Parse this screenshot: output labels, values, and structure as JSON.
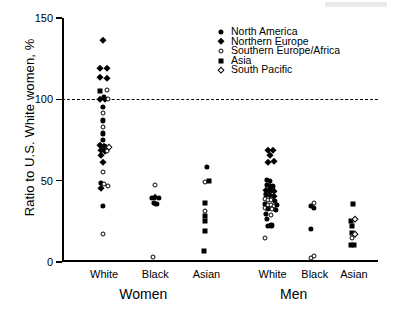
{
  "chart_data": {
    "type": "scatter",
    "title": "",
    "xlabel": "",
    "ylabel": "Ratio to U.S. White women, %",
    "ylim": [
      0,
      150
    ],
    "yticks": [
      0,
      50,
      100,
      150
    ],
    "grid": false,
    "legend_position": "top-right",
    "reference_line": {
      "y": 100,
      "style": "dashed",
      "label": ""
    },
    "group_labels": [
      {
        "label": "Women",
        "x_center": 27
      },
      {
        "label": "Men",
        "x_center": 77
      }
    ],
    "categories": [
      {
        "label": "White",
        "group": "Women",
        "x": 14
      },
      {
        "label": "Black",
        "group": "Women",
        "x": 31
      },
      {
        "label": "Asian",
        "group": "Women",
        "x": 48
      },
      {
        "label": "White",
        "group": "Men",
        "x": 70
      },
      {
        "label": "Black",
        "group": "Men",
        "x": 84
      },
      {
        "label": "Asian",
        "group": "Men",
        "x": 97
      }
    ],
    "series": [
      {
        "name": "North America",
        "marker": "filled-circle"
      },
      {
        "name": "Northern Europe",
        "marker": "filled-diamond"
      },
      {
        "name": "Southern Europe/Africa",
        "marker": "open-circle"
      },
      {
        "name": "Asia",
        "marker": "filled-square"
      },
      {
        "name": "South Pacific",
        "marker": "open-diamond"
      }
    ],
    "points": [
      {
        "x": 13.6,
        "y": 136.5,
        "series": "Northern Europe"
      },
      {
        "x": 12.6,
        "y": 119.5,
        "series": "Northern Europe"
      },
      {
        "x": 14.8,
        "y": 119.5,
        "series": "Northern Europe"
      },
      {
        "x": 12.6,
        "y": 113.5,
        "series": "Northern Europe"
      },
      {
        "x": 14.9,
        "y": 113.0,
        "series": "Northern Europe"
      },
      {
        "x": 12.7,
        "y": 105.0,
        "series": "Asia"
      },
      {
        "x": 15.0,
        "y": 105.5,
        "series": "Southern Europe/Africa"
      },
      {
        "x": 13.9,
        "y": 101.5,
        "series": "North America"
      },
      {
        "x": 12.6,
        "y": 100.5,
        "series": "Northern Europe"
      },
      {
        "x": 14.3,
        "y": 100.0,
        "series": "Northern Europe"
      },
      {
        "x": 15.2,
        "y": 100.0,
        "series": "Southern Europe/Africa"
      },
      {
        "x": 13.6,
        "y": 95.5,
        "series": "North America"
      },
      {
        "x": 13.6,
        "y": 91.5,
        "series": "Southern Europe/Africa"
      },
      {
        "x": 13.6,
        "y": 87.0,
        "series": "North America"
      },
      {
        "x": 13.7,
        "y": 83.0,
        "series": "Southern Europe/Africa"
      },
      {
        "x": 13.6,
        "y": 79.0,
        "series": "North America"
      },
      {
        "x": 13.6,
        "y": 75.0,
        "series": "North America"
      },
      {
        "x": 12.7,
        "y": 72.0,
        "series": "Northern Europe"
      },
      {
        "x": 13.9,
        "y": 71.5,
        "series": "Northern Europe"
      },
      {
        "x": 14.7,
        "y": 71.0,
        "series": "Northern Europe"
      },
      {
        "x": 15.6,
        "y": 70.5,
        "series": "South Pacific"
      },
      {
        "x": 13.0,
        "y": 69.0,
        "series": "Northern Europe"
      },
      {
        "x": 14.2,
        "y": 68.5,
        "series": "Northern Europe"
      },
      {
        "x": 14.9,
        "y": 68.0,
        "series": "Southern Europe/Africa"
      },
      {
        "x": 12.9,
        "y": 66.0,
        "series": "Northern Europe"
      },
      {
        "x": 13.6,
        "y": 61.5,
        "series": "Northern Europe"
      },
      {
        "x": 13.6,
        "y": 55.5,
        "series": "Southern Europe/Africa"
      },
      {
        "x": 13.0,
        "y": 48.5,
        "series": "North America"
      },
      {
        "x": 14.0,
        "y": 48.0,
        "series": "Southern Europe/Africa"
      },
      {
        "x": 15.2,
        "y": 47.0,
        "series": "Southern Europe/Africa"
      },
      {
        "x": 13.0,
        "y": 45.5,
        "series": "Northern Europe"
      },
      {
        "x": 13.6,
        "y": 34.5,
        "series": "North America"
      },
      {
        "x": 13.5,
        "y": 17.5,
        "series": "Southern Europe/Africa"
      },
      {
        "x": 31.0,
        "y": 47.5,
        "series": "Southern Europe/Africa"
      },
      {
        "x": 29.8,
        "y": 39.5,
        "series": "North America"
      },
      {
        "x": 31.0,
        "y": 40.0,
        "series": "Northern Europe"
      },
      {
        "x": 32.2,
        "y": 39.5,
        "series": "North America"
      },
      {
        "x": 30.5,
        "y": 36.5,
        "series": "North America"
      },
      {
        "x": 31.4,
        "y": 35.5,
        "series": "North America"
      },
      {
        "x": 30.4,
        "y": 3.0,
        "series": "Southern Europe/Africa"
      },
      {
        "x": 48.2,
        "y": 58.5,
        "series": "North America"
      },
      {
        "x": 47.6,
        "y": 49.0,
        "series": "Southern Europe/Africa"
      },
      {
        "x": 48.8,
        "y": 50.0,
        "series": "Asia"
      },
      {
        "x": 47.5,
        "y": 36.0,
        "series": "Asia"
      },
      {
        "x": 47.5,
        "y": 31.5,
        "series": "Southern Europe/Africa"
      },
      {
        "x": 47.5,
        "y": 28.5,
        "series": "Asia"
      },
      {
        "x": 47.5,
        "y": 25.5,
        "series": "Asia"
      },
      {
        "x": 47.4,
        "y": 19.0,
        "series": "Asia"
      },
      {
        "x": 47.3,
        "y": 6.5,
        "series": "Asia"
      },
      {
        "x": 68.5,
        "y": 69.0,
        "series": "Northern Europe"
      },
      {
        "x": 70.2,
        "y": 69.0,
        "series": "Northern Europe"
      },
      {
        "x": 69.0,
        "y": 65.5,
        "series": "Northern Europe"
      },
      {
        "x": 68.6,
        "y": 61.5,
        "series": "Northern Europe"
      },
      {
        "x": 70.4,
        "y": 62.0,
        "series": "Northern Europe"
      },
      {
        "x": 68.2,
        "y": 50.5,
        "series": "North America"
      },
      {
        "x": 69.2,
        "y": 50.0,
        "series": "North America"
      },
      {
        "x": 68.0,
        "y": 47.5,
        "series": "North America"
      },
      {
        "x": 69.0,
        "y": 47.0,
        "series": "Northern Europe"
      },
      {
        "x": 70.2,
        "y": 46.5,
        "series": "North America"
      },
      {
        "x": 67.9,
        "y": 44.5,
        "series": "Northern Europe"
      },
      {
        "x": 69.1,
        "y": 44.0,
        "series": "North America"
      },
      {
        "x": 70.6,
        "y": 43.5,
        "series": "Northern Europe"
      },
      {
        "x": 67.8,
        "y": 41.5,
        "series": "North America"
      },
      {
        "x": 69.2,
        "y": 41.0,
        "series": "Northern Europe"
      },
      {
        "x": 70.6,
        "y": 40.5,
        "series": "Northern Europe"
      },
      {
        "x": 67.6,
        "y": 38.5,
        "series": "Southern Europe/Africa"
      },
      {
        "x": 68.6,
        "y": 38.0,
        "series": "Southern Europe/Africa"
      },
      {
        "x": 69.6,
        "y": 38.0,
        "series": "Southern Europe/Africa"
      },
      {
        "x": 70.8,
        "y": 37.5,
        "series": "North America"
      },
      {
        "x": 67.3,
        "y": 35.5,
        "series": "North America"
      },
      {
        "x": 68.3,
        "y": 35.0,
        "series": "Southern Europe/Africa"
      },
      {
        "x": 69.4,
        "y": 35.0,
        "series": "Southern Europe/Africa"
      },
      {
        "x": 70.5,
        "y": 34.5,
        "series": "Southern Europe/Africa"
      },
      {
        "x": 71.5,
        "y": 35.0,
        "series": "North America"
      },
      {
        "x": 67.4,
        "y": 33.0,
        "series": "Southern Europe/Africa"
      },
      {
        "x": 68.5,
        "y": 32.5,
        "series": "North America"
      },
      {
        "x": 69.8,
        "y": 32.5,
        "series": "Southern Europe/Africa"
      },
      {
        "x": 71.0,
        "y": 32.0,
        "series": "North America"
      },
      {
        "x": 67.8,
        "y": 29.5,
        "series": "North America"
      },
      {
        "x": 69.3,
        "y": 29.0,
        "series": "Southern Europe/Africa"
      },
      {
        "x": 68.0,
        "y": 26.5,
        "series": "North America"
      },
      {
        "x": 68.4,
        "y": 22.0,
        "series": "North America"
      },
      {
        "x": 69.6,
        "y": 22.5,
        "series": "North America"
      },
      {
        "x": 67.6,
        "y": 15.0,
        "series": "Southern Europe/Africa"
      },
      {
        "x": 83.6,
        "y": 36.5,
        "series": "Southern Europe/Africa"
      },
      {
        "x": 82.6,
        "y": 34.5,
        "series": "North America"
      },
      {
        "x": 83.8,
        "y": 33.5,
        "series": "North America"
      },
      {
        "x": 82.6,
        "y": 20.5,
        "series": "North America"
      },
      {
        "x": 82.8,
        "y": 2.5,
        "series": "Southern Europe/Africa"
      },
      {
        "x": 83.9,
        "y": 3.5,
        "series": "Southern Europe/Africa"
      },
      {
        "x": 96.8,
        "y": 35.5,
        "series": "Asia"
      },
      {
        "x": 96.0,
        "y": 25.5,
        "series": "Asia"
      },
      {
        "x": 97.4,
        "y": 26.5,
        "series": "South Pacific"
      },
      {
        "x": 96.3,
        "y": 22.0,
        "series": "Asia"
      },
      {
        "x": 96.3,
        "y": 18.0,
        "series": "Asia"
      },
      {
        "x": 97.4,
        "y": 17.5,
        "series": "South Pacific"
      },
      {
        "x": 96.4,
        "y": 14.5,
        "series": "Southern Europe/Africa"
      },
      {
        "x": 95.9,
        "y": 10.5,
        "series": "Asia"
      },
      {
        "x": 97.1,
        "y": 10.5,
        "series": "Asia"
      }
    ]
  }
}
